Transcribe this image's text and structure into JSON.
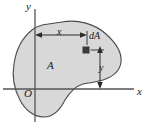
{
  "figure": {
    "background_color": "#ffffff",
    "region_fill": "#d8d8d8",
    "region_stroke": "#4a4a4a",
    "axis_color": "#555555",
    "dimension_color": "#2b2b2b",
    "element_fill": "#3a3a3a",
    "labels": {
      "axis_x": "x",
      "axis_y": "y",
      "origin": "O",
      "area": "A",
      "dimension_x": "x",
      "dimension_y": "y",
      "area_element": "dA"
    },
    "geometry": {
      "origin_px": {
        "x": 35,
        "y": 89
      },
      "x_axis": {
        "x1": 3,
        "y1": 89,
        "x2": 135,
        "y2": 89
      },
      "y_axis": {
        "x1": 35,
        "y1": 9,
        "x2": 35,
        "y2": 122
      },
      "element_square": {
        "x": 82,
        "y": 46,
        "size": 8
      },
      "dimension_x_line": {
        "x1": 36,
        "y1": 35,
        "x2": 86,
        "y2": 35
      },
      "dimension_y_line": {
        "x1": 100,
        "y1": 46,
        "x2": 100,
        "y2": 89
      }
    }
  }
}
